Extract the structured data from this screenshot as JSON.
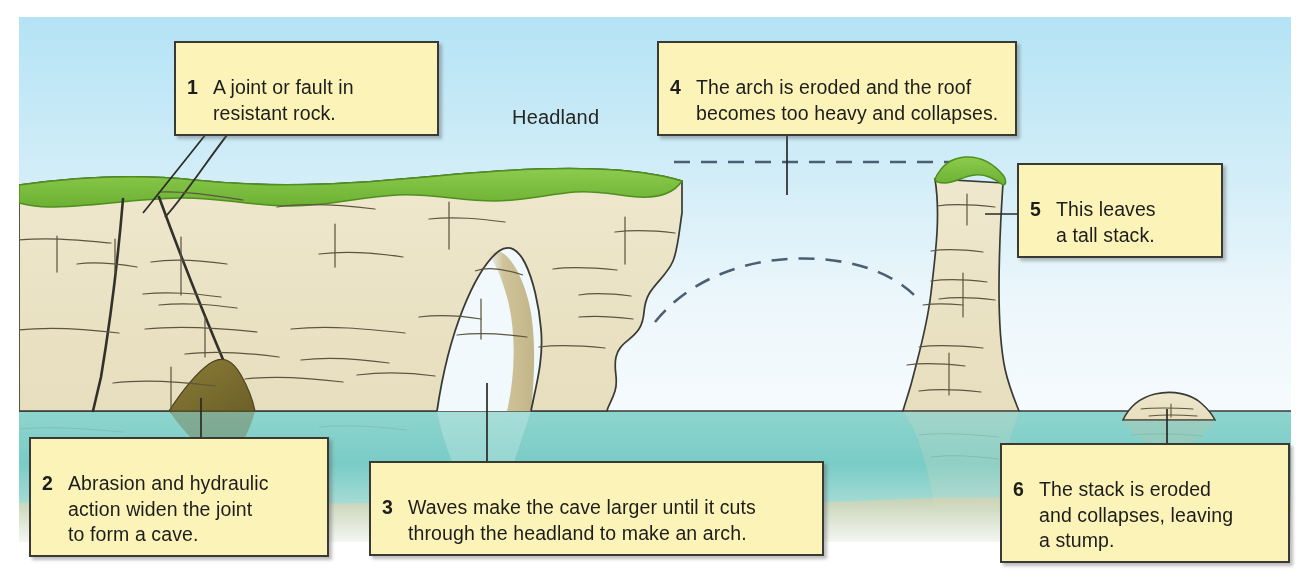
{
  "figure": {
    "annotation_label": "Headland",
    "callouts": [
      {
        "number": "1",
        "text": "A joint or fault in\nresistant rock."
      },
      {
        "number": "2",
        "text": "Abrasion and hydraulic\naction widen the joint\nto form a cave."
      },
      {
        "number": "3",
        "text": "Waves make the cave larger until it cuts\nthrough the headland to make an arch."
      },
      {
        "number": "4",
        "text": "The arch is eroded and the roof\nbecomes too heavy and collapses."
      },
      {
        "number": "5",
        "text": "This leaves\na tall stack."
      },
      {
        "number": "6",
        "text": "The stack is eroded\nand collapses, leaving\na stump."
      }
    ],
    "features": [
      "headland",
      "joint",
      "cave",
      "arch",
      "stack",
      "stump",
      "former-arch-outline",
      "former-headland-level"
    ],
    "colors": {
      "sky_top": "#b8e4f4",
      "sky_bottom": "#eaf6fb",
      "grass": "#7dc242",
      "grass_dark": "#55941f",
      "rock": "#ece4c8",
      "rock_shadow": "#cfc395",
      "cave_dark": "#7d6f30",
      "sea": "#9ed9d4",
      "sea_deep": "#6ec6c0",
      "beach": "#cfd9c2",
      "callout_fill": "#fbf3b8",
      "callout_border": "#3a3a34",
      "outline": "#3a3a34"
    }
  }
}
